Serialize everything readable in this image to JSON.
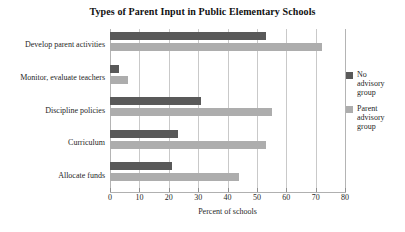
{
  "chart_data": {
    "type": "bar",
    "orientation": "horizontal",
    "title": "Types of Parent Input in Public Elementary Schools",
    "xlabel": "Percent of schools",
    "ylabel": "",
    "categories": [
      "Develop parent activities",
      "Monitor, evaluate teachers",
      "Discipline policies",
      "Curriculum",
      "Allocate funds"
    ],
    "series": [
      {
        "name": "No advisory group",
        "name_lines": [
          "No",
          "advisory",
          "group"
        ],
        "color": "#595959",
        "values": [
          53,
          3,
          31,
          23,
          21
        ]
      },
      {
        "name": "Parent advisory group",
        "name_lines": [
          "Parent",
          "advisory",
          "group"
        ],
        "color": "#adadad",
        "values": [
          72,
          6,
          55,
          53,
          44
        ]
      }
    ],
    "xlim": [
      0,
      80
    ],
    "xticks": [
      0,
      10,
      20,
      30,
      40,
      50,
      60,
      70,
      80
    ],
    "xtick_labels": [
      "0",
      "10",
      "20",
      "30",
      "40",
      "50",
      "60",
      "70",
      "80"
    ],
    "grid": "vertical",
    "legend_position": "right"
  }
}
